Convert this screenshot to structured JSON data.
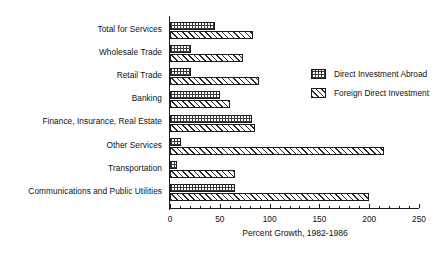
{
  "chart_data": {
    "type": "bar",
    "orientation": "horizontal",
    "title": "",
    "xlabel": "Percent Growth, 1982-1986",
    "ylabel": "",
    "xlim": [
      0,
      250
    ],
    "xticks": [
      0,
      50,
      100,
      150,
      200,
      250
    ],
    "xtick_labels": [
      "0",
      "50",
      "100",
      "150",
      "200",
      "250"
    ],
    "grid": false,
    "legend_position": "upper-right-inside",
    "categories": [
      "Total for Services",
      "Wholesale Trade",
      "Retail Trade",
      "Banking",
      "Finance, Insurance, Real Estate",
      "Other Services",
      "Transportation",
      "Communications and Public Utilities"
    ],
    "series": [
      {
        "name": "Direct Investment Abroad",
        "pattern": "stipple-grid",
        "values": [
          45,
          21,
          21,
          50,
          82,
          11,
          7,
          65
        ]
      },
      {
        "name": "Foreign Direct Investment",
        "pattern": "diagonal-hatch",
        "values": [
          83,
          73,
          89,
          60,
          85,
          215,
          65,
          200
        ]
      }
    ]
  },
  "colors": {
    "ink": "#1a1a1a",
    "background": "#ffffff"
  }
}
